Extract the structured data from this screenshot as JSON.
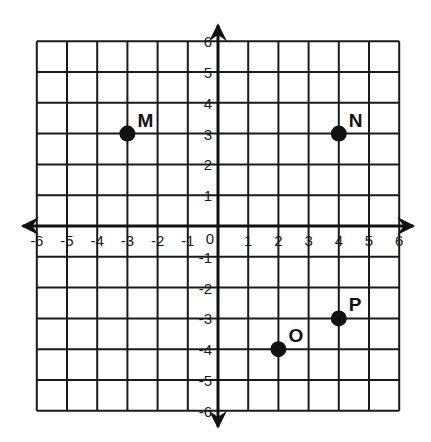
{
  "chart_data": {
    "type": "scatter",
    "title": "",
    "xlabel": "",
    "ylabel": "",
    "xlim": [
      -6,
      6
    ],
    "ylim": [
      -6,
      6
    ],
    "grid": true,
    "x_ticks": [
      -6,
      -5,
      -4,
      -3,
      -2,
      -1,
      0,
      1,
      2,
      3,
      4,
      5,
      6
    ],
    "y_ticks": [
      -6,
      -5,
      -4,
      -3,
      -2,
      -1,
      1,
      2,
      3,
      4,
      5,
      6
    ],
    "origin_label": "0",
    "points": [
      {
        "label": "M",
        "x": -3,
        "y": 3
      },
      {
        "label": "N",
        "x": 4,
        "y": 3
      },
      {
        "label": "O",
        "x": 2,
        "y": -4
      },
      {
        "label": "P",
        "x": 4,
        "y": -3
      }
    ],
    "legend": null
  },
  "colors": {
    "grid": "#1a1a1a",
    "axis": "#111111",
    "point": "#111111",
    "background": "#ffffff"
  }
}
